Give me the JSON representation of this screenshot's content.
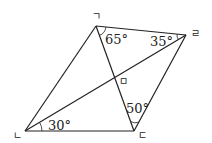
{
  "diagram": {
    "type": "quadrilateral-with-diagonals",
    "vertices": [
      {
        "id": "g",
        "label": "ㄱ",
        "x": 96,
        "y": 26,
        "label_x": 92,
        "label_y": 20
      },
      {
        "id": "r",
        "label": "ㄹ",
        "x": 186,
        "y": 35,
        "label_x": 191,
        "label_y": 37
      },
      {
        "id": "n",
        "label": "ㄴ",
        "x": 25,
        "y": 131,
        "label_x": 13,
        "label_y": 139
      },
      {
        "id": "d",
        "label": "ㄷ",
        "x": 134,
        "y": 131,
        "label_x": 138,
        "label_y": 139
      },
      {
        "id": "m",
        "label": "ㅁ",
        "x": 115,
        "y": 79,
        "label_x": 119,
        "label_y": 85
      }
    ],
    "angles": [
      {
        "vertex": "ㄱ",
        "value": "65°",
        "x": 105,
        "y": 44
      },
      {
        "vertex": "ㄹ",
        "value": "35°",
        "x": 150,
        "y": 46
      },
      {
        "vertex": "ㄴ",
        "value": "30°",
        "x": 48,
        "y": 130
      },
      {
        "vertex": "ㄷ",
        "value": "50°",
        "x": 126,
        "y": 113
      }
    ],
    "stroke_color": "#222222"
  }
}
